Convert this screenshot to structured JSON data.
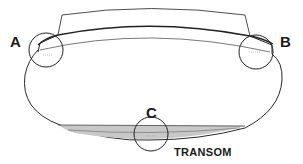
{
  "diagram": {
    "callouts": [
      {
        "id": "A",
        "label": "A",
        "location": "port sheer corner"
      },
      {
        "id": "B",
        "label": "B",
        "location": "starboard sheer corner"
      },
      {
        "id": "C",
        "label": "C",
        "location": "bottom center of transom"
      }
    ],
    "caption": "TRANSOM",
    "colors": {
      "line": "#2a2a2a",
      "shade": "#c8c8c8",
      "background": "#ffffff"
    }
  }
}
